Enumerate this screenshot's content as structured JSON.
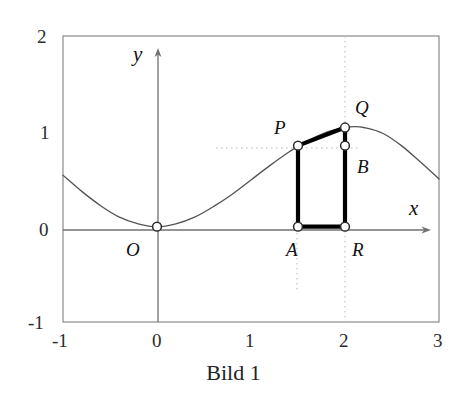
{
  "caption": "Bild 1",
  "axes": {
    "x_name": "x",
    "y_name": "y",
    "x_ticks": [
      "-1",
      "0",
      "1",
      "2",
      "3"
    ],
    "y_ticks": [
      "2",
      "1",
      "0",
      "-1"
    ]
  },
  "point_labels": {
    "O": "O",
    "P": "P",
    "Q": "Q",
    "A": "A",
    "B": "B",
    "R": "R"
  },
  "colors": {
    "curve": "#555555",
    "frame": "#8a8a8a",
    "axis": "#707070",
    "guide": "#bdbdbd",
    "thick": "#000000",
    "marker_fill": "#ffffff"
  },
  "chart_data": {
    "type": "line",
    "title": "Bild 1",
    "xlabel": "x",
    "ylabel": "y",
    "xlim": [
      -1,
      3
    ],
    "ylim": [
      -1,
      2
    ],
    "grid": false,
    "legend": "none",
    "series": [
      {
        "name": "f(x)",
        "description": "smooth wave, zero-tangent minimum at origin, maximum about 1.05 near x = 2.1",
        "x": [
          -1.0,
          -0.8,
          -0.6,
          -0.4,
          -0.2,
          0.0,
          0.2,
          0.4,
          0.6,
          0.8,
          1.0,
          1.2,
          1.4,
          1.5,
          1.6,
          1.8,
          2.0,
          2.1,
          2.2,
          2.4,
          2.6,
          2.8,
          3.0
        ],
        "y": [
          0.54,
          0.37,
          0.22,
          0.1,
          0.03,
          0.0,
          0.03,
          0.1,
          0.21,
          0.34,
          0.49,
          0.64,
          0.78,
          0.84,
          0.9,
          0.99,
          1.04,
          1.05,
          1.04,
          0.98,
          0.85,
          0.68,
          0.5
        ]
      }
    ],
    "points": [
      {
        "label": "O",
        "x": 0.0,
        "y": 0.0
      },
      {
        "label": "P",
        "x": 1.5,
        "y": 0.85
      },
      {
        "label": "Q",
        "x": 2.0,
        "y": 1.04
      },
      {
        "label": "A",
        "x": 1.5,
        "y": 0.0
      },
      {
        "label": "B",
        "x": 2.0,
        "y": 0.85
      },
      {
        "label": "R",
        "x": 2.0,
        "y": 0.0
      }
    ],
    "annotations": [
      "thick segment A-P (vertical at x = 1.5, from y = 0 to y = 0.85)",
      "thick segment A-R (horizontal on x-axis, from x = 1.5 to x = 2)",
      "thick segment R-Q (vertical at x = 2, from y = 0 to y = 1.04)",
      "thick segment P-Q (slanted chord from (1.5, 0.85) to (2, 1.04))",
      "dotted guide line y = 0.85 from x ~ 0.65 to x ~ 2.2",
      "dotted guide line x = 1.5 from y = 0.85 down to y = -0.63",
      "dotted guide line x = 2 spanning the full frame height"
    ]
  }
}
